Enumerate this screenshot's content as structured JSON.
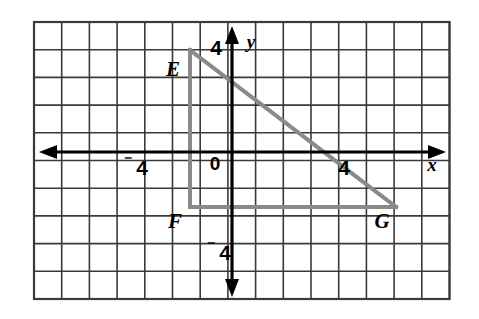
{
  "figure": {
    "type": "coordinate-grid-geometry",
    "background_color": "#ffffff",
    "grid": {
      "line_color": "#3a3a3a",
      "border_color": "#3a3a3a",
      "columns": 15,
      "rows": 10,
      "cell_size_px": 27.7,
      "left_px": 34,
      "top_px": 22,
      "right_px": 449,
      "bottom_px": 299
    },
    "axes": {
      "color": "#000000",
      "x_axis": {
        "label": "x",
        "label_x_px": 432,
        "label_y_px": 167,
        "y_px": 152,
        "start_px": 40,
        "end_px": 445,
        "arrow_both_ends": true
      },
      "y_axis": {
        "label": "y",
        "label_x_px": 250,
        "label_y_px": 42,
        "x_px": 232,
        "start_px": 26,
        "end_px": 297,
        "arrow_both_ends": true
      },
      "origin_label": "0",
      "origin_x_px": 232,
      "origin_y_px": 152
    },
    "tick_labels": [
      {
        "name": "x-negative-four",
        "text": "4",
        "prefix": "⁻",
        "axis": "x",
        "value": -4,
        "x_px": 136,
        "y_px": 170
      },
      {
        "name": "x-positive-four",
        "text": "4",
        "prefix": "",
        "axis": "x",
        "value": 4,
        "x_px": 344,
        "y_px": 170
      },
      {
        "name": "y-positive-four",
        "text": "4",
        "prefix": "",
        "axis": "y",
        "value": 4,
        "x_px": 216,
        "y_px": 50
      },
      {
        "name": "y-negative-four",
        "text": "4",
        "prefix": "⁻",
        "axis": "y",
        "value": -4,
        "x_px": 222,
        "y_px": 256
      }
    ],
    "shape": {
      "name": "triangle EFG",
      "stroke_color": "#8a8a8a",
      "stroke_width_px": 4,
      "fill": "none",
      "vertices": [
        {
          "label": "E",
          "grid_x": -1.5,
          "grid_y": 3.7,
          "px_x": 190,
          "px_y": 50,
          "label_px_x": 172,
          "label_px_y": 72
        },
        {
          "label": "F",
          "grid_x": -1.5,
          "grid_y": -2,
          "px_x": 190,
          "px_y": 207,
          "label_px_x": 174,
          "label_px_y": 225
        },
        {
          "label": "G",
          "grid_x": 7.5,
          "grid_y": -2,
          "px_x": 394,
          "px_y": 207,
          "label_px_x": 380,
          "label_px_y": 225
        }
      ],
      "edges": [
        {
          "name": "edge-EF",
          "from": "E",
          "to": "F",
          "orientation": "vertical"
        },
        {
          "name": "edge-FG",
          "from": "F",
          "to": "G",
          "orientation": "horizontal"
        },
        {
          "name": "edge-GE",
          "from": "G",
          "to": "E",
          "orientation": "hypotenuse"
        }
      ]
    }
  }
}
